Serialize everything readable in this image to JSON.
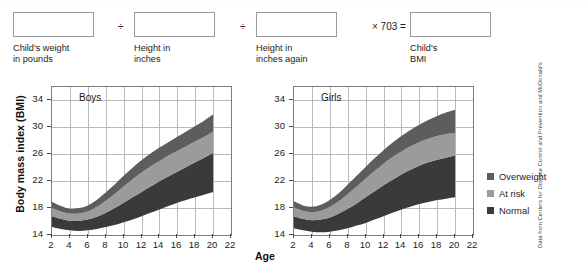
{
  "formula": {
    "label": "BMI calculation formula",
    "fields": [
      {
        "name": "childs-weight",
        "value": "",
        "placeholder": "",
        "caption": "Child's weight\nin pounds"
      },
      {
        "name": "height-inches",
        "value": "",
        "placeholder": "",
        "caption": "Height in\ninches"
      },
      {
        "name": "height-inches-again",
        "value": "",
        "placeholder": "",
        "caption": "Height in\ninches again"
      },
      {
        "name": "childs-bmi",
        "value": "",
        "placeholder": "",
        "caption": "Child's\nBMI"
      }
    ],
    "operators": [
      "÷",
      "÷",
      "× 703 ="
    ]
  },
  "legend": {
    "items": [
      {
        "label": "Overweight",
        "color": "#5d5d5d"
      },
      {
        "label": "At risk",
        "color": "#9b9b9b"
      },
      {
        "label": "Normal",
        "color": "#3a3a3a"
      }
    ]
  },
  "source_note": "Data from Centers for Disease Control and Prevention and McDonald's",
  "axis_titles": {
    "y": "Body mass index (BMI)",
    "x": "Age"
  },
  "colors": {
    "overweight": "#5d5d5d",
    "at_risk": "#9b9b9b",
    "normal": "#3a3a3a",
    "grid": "#b9b9b9",
    "axis": "#7d7d7d"
  },
  "chart_data": [
    {
      "type": "area",
      "name": "boys-bmi-chart",
      "title": "Boys",
      "xlabel": "Age",
      "ylabel": "Body mass index (BMI)",
      "xlim": [
        2,
        22
      ],
      "ylim": [
        14,
        36
      ],
      "xticks": [
        2,
        4,
        6,
        8,
        10,
        12,
        14,
        16,
        18,
        20,
        22
      ],
      "yticks": [
        14,
        18,
        22,
        26,
        30,
        34
      ],
      "grid": true,
      "legend_position": "right-outside",
      "x": [
        2,
        3,
        4,
        5,
        6,
        7,
        8,
        9,
        10,
        11,
        12,
        13,
        14,
        15,
        16,
        17,
        18,
        19,
        20
      ],
      "series": [
        {
          "name": "Normal",
          "note": "lower boundary of normal band",
          "values": [
            15.2,
            14.9,
            14.7,
            14.6,
            14.7,
            14.9,
            15.2,
            15.5,
            15.9,
            16.3,
            16.8,
            17.3,
            17.8,
            18.3,
            18.8,
            19.2,
            19.6,
            20.0,
            20.4
          ]
        },
        {
          "name": "Normal/At risk boundary (85th percentile)",
          "values": [
            16.8,
            16.4,
            16.1,
            16.1,
            16.3,
            16.7,
            17.3,
            18.0,
            18.8,
            19.6,
            20.4,
            21.2,
            22.0,
            22.7,
            23.4,
            24.1,
            24.8,
            25.5,
            26.2
          ]
        },
        {
          "name": "At risk/Overweight boundary (95th percentile)",
          "values": [
            18.0,
            17.5,
            17.2,
            17.2,
            17.5,
            18.2,
            19.1,
            20.1,
            21.2,
            22.3,
            23.3,
            24.2,
            25.0,
            25.8,
            26.5,
            27.2,
            27.9,
            28.6,
            29.4
          ]
        },
        {
          "name": "Overweight upper edge",
          "values": [
            18.9,
            18.3,
            17.9,
            18.0,
            18.4,
            19.2,
            20.3,
            21.5,
            22.8,
            24.0,
            25.1,
            26.1,
            27.0,
            27.8,
            28.6,
            29.4,
            30.2,
            31.0,
            31.9
          ]
        }
      ]
    },
    {
      "type": "area",
      "name": "girls-bmi-chart",
      "title": "Girls",
      "xlabel": "Age",
      "ylabel": "Body mass index (BMI)",
      "xlim": [
        2,
        22
      ],
      "ylim": [
        14,
        36
      ],
      "xticks": [
        2,
        4,
        6,
        8,
        10,
        12,
        14,
        16,
        18,
        20,
        22
      ],
      "yticks": [
        14,
        18,
        22,
        26,
        30,
        34
      ],
      "grid": true,
      "legend_position": "right-outside",
      "x": [
        2,
        3,
        4,
        5,
        6,
        7,
        8,
        9,
        10,
        11,
        12,
        13,
        14,
        15,
        16,
        17,
        18,
        19,
        20
      ],
      "series": [
        {
          "name": "Normal",
          "note": "lower boundary of normal band",
          "values": [
            15.0,
            14.7,
            14.5,
            14.4,
            14.5,
            14.7,
            15.0,
            15.4,
            15.8,
            16.3,
            16.8,
            17.3,
            17.8,
            18.2,
            18.6,
            18.9,
            19.2,
            19.4,
            19.6
          ]
        },
        {
          "name": "Normal/At risk boundary (85th percentile)",
          "values": [
            16.8,
            16.4,
            16.2,
            16.3,
            16.6,
            17.2,
            17.9,
            18.7,
            19.6,
            20.5,
            21.4,
            22.2,
            23.0,
            23.7,
            24.3,
            24.8,
            25.2,
            25.5,
            25.8
          ]
        },
        {
          "name": "At risk/Overweight boundary (95th percentile)",
          "values": [
            18.1,
            17.6,
            17.4,
            17.6,
            18.2,
            19.0,
            20.1,
            21.2,
            22.4,
            23.5,
            24.6,
            25.6,
            26.4,
            27.2,
            27.8,
            28.3,
            28.7,
            29.0,
            29.2
          ]
        },
        {
          "name": "Overweight upper edge",
          "values": [
            19.0,
            18.4,
            18.2,
            18.5,
            19.2,
            20.2,
            21.5,
            22.8,
            24.1,
            25.4,
            26.6,
            27.7,
            28.7,
            29.6,
            30.4,
            31.1,
            31.7,
            32.2,
            32.6
          ]
        }
      ]
    }
  ]
}
